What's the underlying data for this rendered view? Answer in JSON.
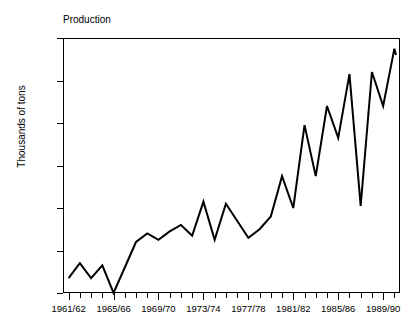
{
  "chart_data": {
    "type": "line",
    "title": "Production",
    "xlabel": "",
    "ylabel": "Thousands of tons",
    "ylim": [
      50,
      170
    ],
    "yticks": [
      50,
      70,
      90,
      110,
      130,
      150,
      170
    ],
    "grid": false,
    "legend": null,
    "line_color": "#000000",
    "x": [
      "1961/62",
      "1962/63",
      "1963/64",
      "1964/65",
      "1965/66",
      "1966/67",
      "1967/68",
      "1968/69",
      "1969/70",
      "1970/71",
      "1971/72",
      "1972/73",
      "1973/74",
      "1974/75",
      "1975/76",
      "1976/77",
      "1977/78",
      "1978/79",
      "1979/80",
      "1980/81",
      "1981/82",
      "1982/83",
      "1983/84",
      "1984/85",
      "1985/86",
      "1986/87",
      "1987/88",
      "1988/89",
      "1989/90",
      "1990/91"
    ],
    "values": [
      57,
      64,
      57,
      63,
      50,
      62,
      74,
      78,
      75,
      79,
      82,
      77,
      93,
      75,
      92,
      84,
      76,
      80,
      86,
      105,
      90,
      129,
      105,
      138,
      123,
      153,
      91,
      154,
      138,
      165
    ],
    "xtick_labels": [
      "1961/62",
      "1965/66",
      "1969/70",
      "1973/74",
      "1977/78",
      "1981/82",
      "1985/86",
      "1989/90"
    ],
    "xtick_label_indices": [
      0,
      4,
      8,
      12,
      16,
      20,
      24,
      28
    ],
    "last_point_value": 162
  }
}
